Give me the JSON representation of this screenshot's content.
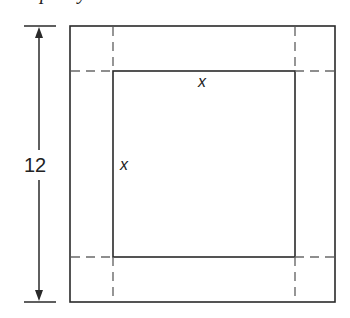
{
  "caption_fragment": {
    "text_visible": "cropped descenders of a caption line (e.g. \"p\" and \"y\")",
    "glyph_1": "p",
    "glyph_2": "y"
  },
  "diagram": {
    "dimension_label": "12",
    "inner_side_label_top": "x",
    "inner_side_label_left": "x",
    "outer_square": {
      "x": 70,
      "y": 26,
      "width": 265,
      "height": 276
    },
    "inner_square": {
      "x": 113,
      "y": 71,
      "width": 182,
      "height": 186
    },
    "dashed_lines": {
      "vertical_x": [
        113,
        295
      ],
      "horizontal_y": [
        71,
        257
      ]
    },
    "dimension_arrow": {
      "x": 39,
      "y_top": 26,
      "y_bottom": 302,
      "tick_x_start": 24,
      "tick_x_end": 56
    },
    "colors": {
      "line": "#2a2a2a",
      "dashed": "#6a6a6a",
      "background": "#ffffff"
    }
  }
}
